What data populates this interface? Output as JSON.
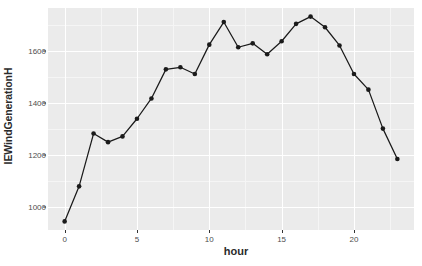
{
  "chart_data": {
    "type": "line",
    "title": "",
    "xlabel": "hour",
    "ylabel": "IEWindGenerationH",
    "x": [
      0,
      1,
      2,
      3,
      4,
      5,
      6,
      7,
      8,
      9,
      10,
      11,
      12,
      13,
      14,
      15,
      16,
      17,
      18,
      19,
      20,
      21,
      22,
      23
    ],
    "values": [
      945,
      1080,
      1283,
      1250,
      1272,
      1340,
      1418,
      1530,
      1538,
      1512,
      1625,
      1712,
      1615,
      1630,
      1588,
      1638,
      1705,
      1733,
      1692,
      1622,
      1512,
      1452,
      1302,
      1185
    ],
    "series": [
      {
        "name": "IEWindGenerationH",
        "values": [
          945,
          1080,
          1283,
          1250,
          1272,
          1340,
          1418,
          1530,
          1538,
          1512,
          1625,
          1712,
          1615,
          1630,
          1588,
          1638,
          1705,
          1733,
          1692,
          1622,
          1512,
          1452,
          1302,
          1185
        ]
      }
    ],
    "xlim": [
      -1.15,
      24.15
    ],
    "ylim": [
      912,
      1766
    ],
    "xticks": [
      0,
      5,
      10,
      15,
      20
    ],
    "xtick_labels": [
      "0",
      "5",
      "10",
      "15",
      "20"
    ],
    "yticks": [
      1000,
      1200,
      1400,
      1600
    ],
    "ytick_labels": [
      "1000",
      "1200",
      "1400",
      "1600"
    ],
    "y_minor_ticks": [
      1100,
      1300,
      1500,
      1700
    ],
    "x_minor_ticks": [
      2.5,
      7.5,
      12.5,
      17.5,
      22.5
    ],
    "grid": true,
    "legend": "none",
    "marker": "circle",
    "marker_color": "#1a1a1a",
    "line_color": "#1a1a1a",
    "panel_background": "#ebebeb",
    "grid_major_color": "#ffffff",
    "grid_minor_color": "#f5f5f5",
    "plot_background": "#ffffff"
  }
}
